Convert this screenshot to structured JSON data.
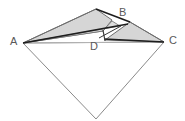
{
  "figure": {
    "type": "geometry-diagram",
    "canvas": {
      "width": 185,
      "height": 121
    },
    "colors": {
      "background": "#ffffff",
      "shade_fill": "#d6d6d6",
      "shade_fill_light": "#dedede",
      "thin_stroke": "#6e6e6e",
      "thick_stroke": "#1d1d1d",
      "faint_stroke": "#b4b4b4",
      "label_color": "#5a5a5a"
    },
    "labels": [
      {
        "id": "A",
        "text": "A",
        "x": 10,
        "y": 36
      },
      {
        "id": "B",
        "text": "B",
        "x": 119,
        "y": 7
      },
      {
        "id": "C",
        "text": "C",
        "x": 169,
        "y": 35
      },
      {
        "id": "D",
        "text": "D",
        "x": 90,
        "y": 41
      }
    ],
    "points": {
      "A": {
        "x": 23,
        "y": 43
      },
      "B": {
        "x": 130,
        "y": 22
      },
      "C": {
        "x": 164,
        "y": 42
      },
      "D": {
        "x": 99,
        "y": 38
      },
      "apex": {
        "x": 96,
        "y": 9
      },
      "bottom": {
        "x": 96,
        "y": 119
      },
      "crease_top": {
        "x": 112,
        "y": 20
      },
      "crease_mid": {
        "x": 103,
        "y": 30
      },
      "crease_low": {
        "x": 105,
        "y": 40
      }
    },
    "shapes": [
      {
        "name": "left-shaded-flap",
        "kind": "polygon",
        "fill": "#d6d6d6",
        "stroke": "#6e6e6e",
        "stroke_width": 1,
        "points": "23,43 96,9 112,20 103,31"
      },
      {
        "name": "right-shaded-flap",
        "kind": "polygon",
        "fill": "#d6d6d6",
        "stroke": "#6e6e6e",
        "stroke_width": 1,
        "points": "105,40 130,22 164,42"
      },
      {
        "name": "inner-sliver",
        "kind": "polygon",
        "fill": "#dedede",
        "stroke": "#6e6e6e",
        "stroke_width": 0.8,
        "points": "23,43 103,31 112,21 120,26"
      },
      {
        "name": "lower-kite",
        "kind": "polygon",
        "fill": "none",
        "stroke": "#8a8a8a",
        "stroke_width": 1,
        "points": "23,43 96,119 164,42"
      }
    ],
    "lines": [
      {
        "name": "diagonal-A-C",
        "x1": 23,
        "y1": 43,
        "x2": 164,
        "y2": 42,
        "stroke": "#b4b4b4",
        "stroke_width": 1
      },
      {
        "name": "edge-A-apex",
        "x1": 23,
        "y1": 43,
        "x2": 96,
        "y2": 9,
        "stroke": "#6e6e6e",
        "stroke_width": 1
      },
      {
        "name": "edge-apex-B",
        "x1": 96,
        "y1": 9,
        "x2": 130,
        "y2": 22,
        "stroke": "#1d1d1d",
        "stroke_width": 1.6
      },
      {
        "name": "edge-B-C",
        "x1": 130,
        "y1": 22,
        "x2": 164,
        "y2": 42,
        "stroke": "#6e6e6e",
        "stroke_width": 1
      },
      {
        "name": "crease-A-to-B",
        "x1": 23,
        "y1": 43,
        "x2": 128,
        "y2": 24,
        "stroke": "#1d1d1d",
        "stroke_width": 1.4
      },
      {
        "name": "crease-D-to-C",
        "x1": 104,
        "y1": 39,
        "x2": 164,
        "y2": 42,
        "stroke": "#1d1d1d",
        "stroke_width": 1.6
      },
      {
        "name": "crease-fold-vertical",
        "x1": 103,
        "y1": 30,
        "x2": 105,
        "y2": 41,
        "stroke": "#3a3a3a",
        "stroke_width": 1.2
      },
      {
        "name": "crease-D-to-apexline",
        "x1": 99,
        "y1": 38,
        "x2": 120,
        "y2": 26,
        "stroke": "#3a3a3a",
        "stroke_width": 1
      }
    ]
  }
}
